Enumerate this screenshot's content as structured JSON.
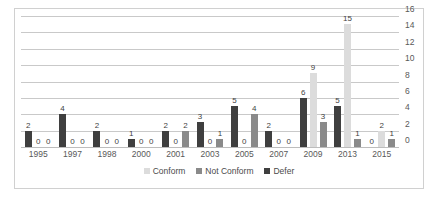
{
  "chart_data": {
    "type": "bar",
    "title": "",
    "subtitle": "",
    "xlabel": "",
    "ylabel": "",
    "ylim": [
      0,
      16
    ],
    "ytick_step": 2,
    "yticks": [
      16,
      14,
      12,
      10,
      8,
      6,
      4,
      2,
      0
    ],
    "yaxis_position": "right",
    "grid": true,
    "grid_orientation": "horizontal",
    "legend_position": "bottom",
    "legend_order": [
      "Conform",
      "Not Conform",
      "Defer"
    ],
    "bar_draw_order": [
      "Defer",
      "Conform",
      "Not Conform"
    ],
    "data_labels": true,
    "categories": [
      "1995",
      "1997",
      "1998",
      "2000",
      "2001",
      "2003",
      "2005",
      "2007",
      "2009",
      "2013",
      "2015"
    ],
    "series": [
      {
        "name": "Conform",
        "color": "#dcdcdc",
        "values": [
          0,
          0,
          0,
          0,
          0,
          0,
          0,
          0,
          9,
          15,
          2
        ]
      },
      {
        "name": "Not Conform",
        "color": "#8a8a8a",
        "values": [
          0,
          0,
          0,
          0,
          2,
          1,
          4,
          0,
          3,
          1,
          1
        ]
      },
      {
        "name": "Defer",
        "color": "#3f3f3f",
        "values": [
          2,
          4,
          2,
          1,
          2,
          3,
          5,
          2,
          6,
          5,
          0
        ]
      }
    ]
  },
  "colors": {
    "conform": "#dcdcdc",
    "not_conform": "#8a8a8a",
    "defer": "#3f3f3f",
    "gridline": "#c9c9c9",
    "border": "#d0d0d0",
    "axis_text": "#595959",
    "label_text": "#3f3f3f",
    "background": "#ffffff"
  }
}
